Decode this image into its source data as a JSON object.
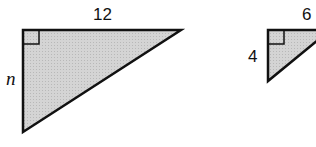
{
  "figure": {
    "triangles": [
      {
        "name": "large-right-triangle",
        "top_leg_label": "12",
        "left_leg_label": "n",
        "right_angle": "top-left"
      },
      {
        "name": "small-right-triangle",
        "top_leg_label": "6",
        "left_leg_label": "4",
        "right_angle": "top-left"
      }
    ],
    "colors": {
      "fill": "#cfcfcf",
      "stroke": "#111111"
    }
  }
}
